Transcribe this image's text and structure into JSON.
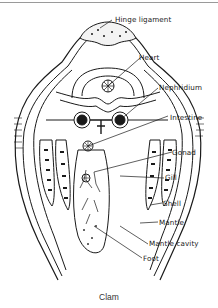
{
  "figure": {
    "caption": "Clam",
    "labels": [
      {
        "id": "hinge-ligament",
        "text": "Hinge ligament"
      },
      {
        "id": "heart",
        "text": "Heart"
      },
      {
        "id": "nephridium",
        "text": "Nephridium"
      },
      {
        "id": "intestine",
        "text": "Intestine"
      },
      {
        "id": "gonad",
        "text": "Gonad"
      },
      {
        "id": "gill",
        "text": "Gill"
      },
      {
        "id": "shell",
        "text": "Shell"
      },
      {
        "id": "mantle",
        "text": "Mantle"
      },
      {
        "id": "mantle-cavity",
        "text": "Mantle cavity"
      },
      {
        "id": "foot",
        "text": "Foot"
      }
    ],
    "colors": {
      "ink": "#1a1a1a",
      "background": "#ffffff"
    }
  }
}
